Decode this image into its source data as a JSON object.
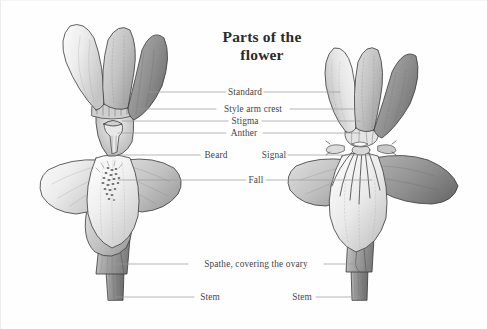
{
  "diagram": {
    "title_line1": "Parts of the",
    "title_line2": "flower",
    "background_color": "#fefefe",
    "ink_color": "#45454a",
    "leader_line_color": "#9a9a9a"
  },
  "labels": {
    "standard": "Standard",
    "style_arm_crest": "Style arm crest",
    "stigma": "Stigma",
    "anther": "Anther",
    "beard": "Beard",
    "signal": "Signal",
    "fall": "Fall",
    "spathe": "Spathe, covering the ovary",
    "stem_left": "Stem",
    "stem_right": "Stem"
  },
  "figures": {
    "left": {
      "name": "bearded-iris",
      "parts": [
        "Standard",
        "Style arm crest",
        "Stigma",
        "Anther",
        "Beard",
        "Fall",
        "Spathe, covering the ovary",
        "Stem"
      ]
    },
    "right": {
      "name": "beardless-iris",
      "parts": [
        "Standard",
        "Style arm crest",
        "Stigma",
        "Anther",
        "Signal",
        "Fall",
        "Spathe, covering the ovary",
        "Stem"
      ]
    }
  }
}
